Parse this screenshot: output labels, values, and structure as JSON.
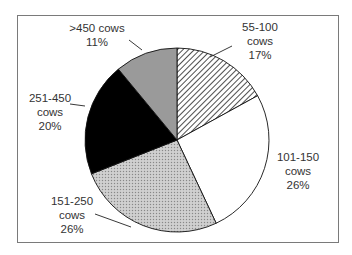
{
  "chart_data": {
    "type": "pie",
    "title": "",
    "start_angle": "12 o'clock",
    "direction": "clockwise",
    "categories": [
      "55-100 cows",
      "101-150 cows",
      "151-250 cows",
      "251-450 cows",
      ">450 cows"
    ],
    "values": [
      17,
      26,
      26,
      20,
      11
    ],
    "unit": "%",
    "fills": [
      "diagonal-hatch",
      "#ffffff",
      "dotted-light-gray",
      "#000000",
      "#9a9a9a"
    ],
    "legend": "none (data labels with leader lines)"
  },
  "labels": [
    {
      "line1": "55-100",
      "line2": "cows",
      "pct": "17%"
    },
    {
      "line1": "101-150",
      "line2": "cows",
      "pct": "26%"
    },
    {
      "line1": "151-250",
      "line2": "cows",
      "pct": "26%"
    },
    {
      "line1": "251-450",
      "line2": "cows",
      "pct": "20%"
    },
    {
      "line1": ">450 cows",
      "pct": "11%"
    }
  ]
}
